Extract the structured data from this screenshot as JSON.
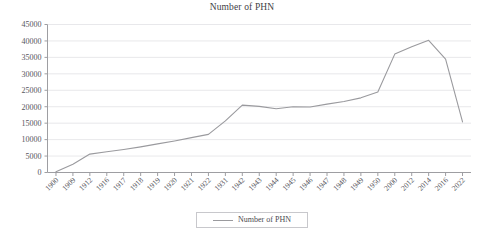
{
  "chart_data": {
    "type": "line",
    "title": "Number of PHN",
    "xlabel": "",
    "ylabel": "",
    "ylim": [
      0,
      45000
    ],
    "ytick_step": 5000,
    "yticks": [
      0,
      5000,
      10000,
      15000,
      20000,
      25000,
      30000,
      35000,
      40000,
      45000
    ],
    "grid": true,
    "legend_position": "bottom",
    "line_color": "#9a9a9e",
    "categories": [
      "1900",
      "1909",
      "1912",
      "1916",
      "1917",
      "1918",
      "1919",
      "1920",
      "1921",
      "1922",
      "1931",
      "1942",
      "1943",
      "1944",
      "1945",
      "1946",
      "1947",
      "1948",
      "1949",
      "1950",
      "2000",
      "2012",
      "2014",
      "2016",
      "2022"
    ],
    "series": [
      {
        "name": "Number of PHN",
        "values": [
          200,
          2500,
          5600,
          6300,
          7000,
          7800,
          8700,
          9600,
          10600,
          11600,
          15700,
          20500,
          20100,
          19400,
          20000,
          19900,
          20800,
          21600,
          22700,
          24500,
          36000,
          38200,
          40200,
          34500,
          15400
        ]
      }
    ],
    "legend": [
      "Number of PHN"
    ]
  },
  "legend": {
    "label": "Number of PHN",
    "swatch_name": "line-swatch"
  }
}
